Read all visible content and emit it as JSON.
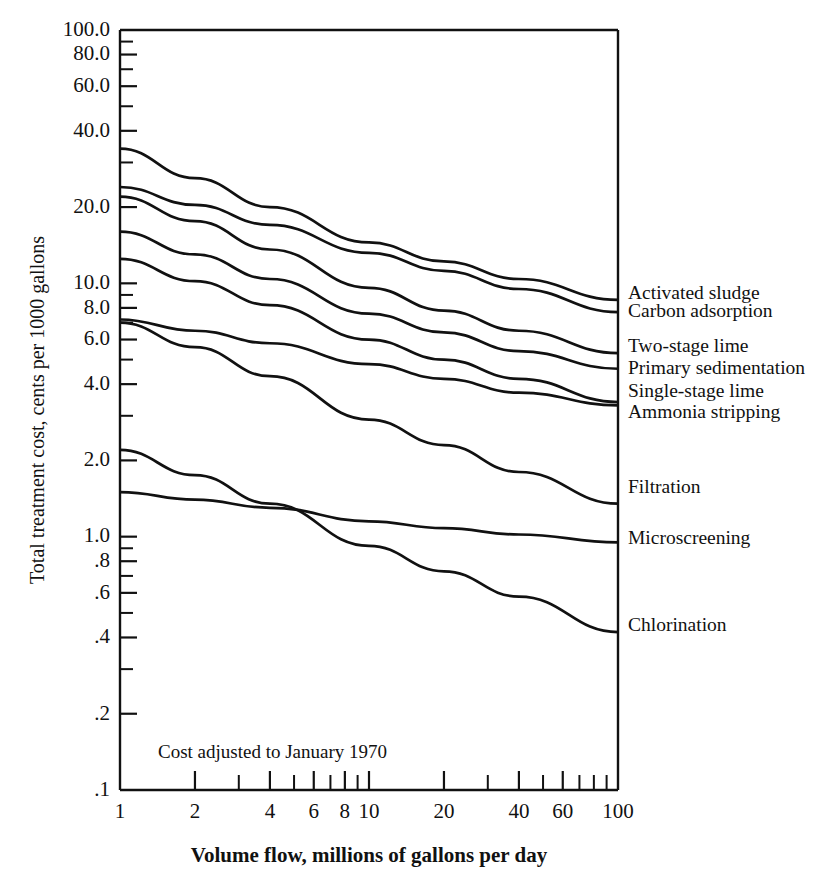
{
  "chart_data": {
    "type": "line",
    "title": "",
    "xlabel": "Volume flow, millions of gallons per day",
    "ylabel": "Total treatment cost, cents per 1000 gallons",
    "xscale": "log",
    "yscale": "log",
    "xlim": [
      1,
      100
    ],
    "ylim": [
      0.1,
      100
    ],
    "grid": false,
    "legend_position": "right-inline-labels",
    "annotation": "Cost adjusted to January 1970",
    "x_ticks_labeled": [
      {
        "value": 1,
        "label": "1"
      },
      {
        "value": 2,
        "label": "2"
      },
      {
        "value": 4,
        "label": "4"
      },
      {
        "value": 6,
        "label": "6"
      },
      {
        "value": 8,
        "label": "8"
      },
      {
        "value": 10,
        "label": "10"
      },
      {
        "value": 20,
        "label": "20"
      },
      {
        "value": 40,
        "label": "40"
      },
      {
        "value": 60,
        "label": "60"
      },
      {
        "value": 100,
        "label": "100"
      }
    ],
    "x_ticks_minor": [
      3,
      5,
      7,
      9,
      30,
      50,
      70,
      80,
      90
    ],
    "y_ticks_labeled": [
      {
        "value": 100,
        "label": "100.0"
      },
      {
        "value": 80,
        "label": "80.0"
      },
      {
        "value": 60,
        "label": "60.0"
      },
      {
        "value": 40,
        "label": "40.0"
      },
      {
        "value": 20,
        "label": "20.0"
      },
      {
        "value": 10,
        "label": "10.0"
      },
      {
        "value": 8,
        "label": "8.0"
      },
      {
        "value": 6,
        "label": "6.0"
      },
      {
        "value": 4,
        "label": "4.0"
      },
      {
        "value": 2,
        "label": "2.0"
      },
      {
        "value": 1,
        "label": "1.0"
      },
      {
        "value": 0.8,
        "label": ".8"
      },
      {
        "value": 0.6,
        "label": ".6"
      },
      {
        "value": 0.4,
        "label": ".4"
      },
      {
        "value": 0.2,
        "label": ".2"
      },
      {
        "value": 0.1,
        "label": ".1"
      }
    ],
    "y_ticks_minor": [
      90,
      70,
      50,
      30,
      9,
      7,
      5,
      3,
      0.9,
      0.7,
      0.5,
      0.3
    ],
    "series": [
      {
        "name": "Activated sludge",
        "label_y": 9.0,
        "points": [
          [
            1,
            34.0
          ],
          [
            2,
            26.0
          ],
          [
            4,
            20.0
          ],
          [
            10,
            14.5
          ],
          [
            20,
            12.2
          ],
          [
            40,
            10.4
          ],
          [
            100,
            8.6
          ]
        ]
      },
      {
        "name": "Carbon adsorption",
        "label_y": 7.7,
        "points": [
          [
            1,
            24.0
          ],
          [
            2,
            20.4
          ],
          [
            4,
            17.0
          ],
          [
            10,
            13.2
          ],
          [
            20,
            11.2
          ],
          [
            40,
            9.5
          ],
          [
            100,
            7.7
          ]
        ]
      },
      {
        "name": "Two-stage lime",
        "label_y": 5.6,
        "points": [
          [
            1,
            22.0
          ],
          [
            2,
            17.6
          ],
          [
            4,
            13.6
          ],
          [
            10,
            9.6
          ],
          [
            20,
            7.8
          ],
          [
            40,
            6.5
          ],
          [
            100,
            5.3
          ]
        ]
      },
      {
        "name": "Primary sedimentation",
        "label_y": 4.55,
        "points": [
          [
            1,
            16.0
          ],
          [
            2,
            13.0
          ],
          [
            4,
            10.4
          ],
          [
            10,
            7.6
          ],
          [
            20,
            6.4
          ],
          [
            40,
            5.4
          ],
          [
            100,
            4.6
          ]
        ]
      },
      {
        "name": "Single-stage lime",
        "label_y": 3.7,
        "points": [
          [
            1,
            12.5
          ],
          [
            2,
            10.2
          ],
          [
            4,
            8.2
          ],
          [
            10,
            6.0
          ],
          [
            20,
            5.0
          ],
          [
            40,
            4.2
          ],
          [
            100,
            3.4
          ]
        ]
      },
      {
        "name": "Ammonia stripping",
        "label_y": 3.05,
        "points": [
          [
            1,
            7.2
          ],
          [
            2,
            6.5
          ],
          [
            4,
            5.8
          ],
          [
            10,
            4.8
          ],
          [
            20,
            4.2
          ],
          [
            40,
            3.7
          ],
          [
            100,
            3.3
          ]
        ]
      },
      {
        "name": "Filtration",
        "label_y": 1.55,
        "points": [
          [
            1,
            7.0
          ],
          [
            2,
            5.6
          ],
          [
            4,
            4.3
          ],
          [
            10,
            2.9
          ],
          [
            20,
            2.3
          ],
          [
            40,
            1.8
          ],
          [
            100,
            1.35
          ]
        ]
      },
      {
        "name": "Microscreening",
        "label_y": 0.97,
        "points": [
          [
            1,
            1.5
          ],
          [
            2,
            1.4
          ],
          [
            4,
            1.3
          ],
          [
            10,
            1.15
          ],
          [
            20,
            1.08
          ],
          [
            40,
            1.02
          ],
          [
            100,
            0.95
          ]
        ]
      },
      {
        "name": "Chlorination",
        "label_y": 0.44,
        "points": [
          [
            1,
            2.2
          ],
          [
            2,
            1.75
          ],
          [
            4,
            1.35
          ],
          [
            10,
            0.92
          ],
          [
            20,
            0.73
          ],
          [
            40,
            0.58
          ],
          [
            100,
            0.42
          ]
        ]
      }
    ]
  }
}
